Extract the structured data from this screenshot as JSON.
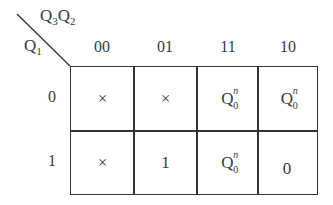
{
  "kmap": {
    "corner_top": {
      "base": "Q",
      "sub1": "3",
      "base2": "Q",
      "sub2": "2"
    },
    "corner_left": {
      "base": "Q",
      "sub": "1"
    },
    "columns": [
      "00",
      "01",
      "11",
      "10"
    ],
    "rows": [
      "0",
      "1"
    ],
    "cells": [
      [
        {
          "type": "text",
          "value": "×"
        },
        {
          "type": "text",
          "value": "×"
        },
        {
          "type": "q",
          "base": "Q",
          "sup": "n",
          "sub": "0"
        },
        {
          "type": "q",
          "base": "Q",
          "sup": "n",
          "sub": "0"
        }
      ],
      [
        {
          "type": "text",
          "value": "×"
        },
        {
          "type": "text",
          "value": "1"
        },
        {
          "type": "q",
          "base": "Q",
          "sup": "n",
          "sub": "0"
        },
        {
          "type": "text",
          "value": "0"
        }
      ]
    ]
  }
}
